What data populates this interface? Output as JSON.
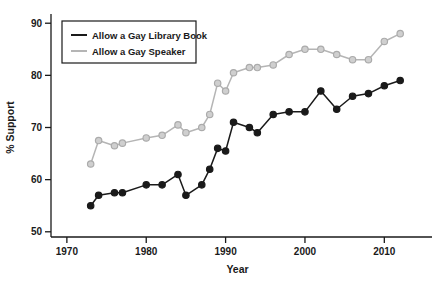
{
  "chart_data": {
    "type": "line",
    "title": "",
    "xlabel": "Year",
    "ylabel": "% Support",
    "xlim": [
      1968,
      2015
    ],
    "ylim": [
      49,
      91
    ],
    "xticks": [
      1970,
      1980,
      1990,
      2000,
      2010
    ],
    "xtick_labels": [
      "1970",
      "1980",
      "1990",
      "2000",
      "2010"
    ],
    "yticks": [
      50,
      60,
      70,
      80,
      90
    ],
    "ytick_labels": [
      "50",
      "60",
      "70",
      "80",
      "90"
    ],
    "grid": false,
    "legend_position": "top-left",
    "series": [
      {
        "name": "Allow a Gay Library Book",
        "color": "#1a1a1a",
        "marker": "filled-circle",
        "x": [
          1973,
          1974,
          1976,
          1977,
          1980,
          1982,
          1984,
          1985,
          1987,
          1988,
          1989,
          1990,
          1991,
          1993,
          1994,
          1996,
          1998,
          2000,
          2002,
          2004,
          2006,
          2008,
          2010,
          2012
        ],
        "values": [
          55.0,
          57.0,
          57.5,
          57.5,
          59.0,
          59.0,
          61.0,
          57.0,
          59.0,
          62.0,
          66.0,
          65.5,
          71.0,
          70.0,
          69.0,
          72.5,
          73.0,
          73.0,
          77.0,
          73.5,
          76.0,
          76.5,
          78.0,
          79.0
        ]
      },
      {
        "name": "Allow a Gay Speaker",
        "color": "#b5b5b5",
        "marker": "filled-circle",
        "x": [
          1973,
          1974,
          1976,
          1977,
          1980,
          1982,
          1984,
          1985,
          1987,
          1988,
          1989,
          1990,
          1991,
          1993,
          1994,
          1996,
          1998,
          2000,
          2002,
          2004,
          2006,
          2008,
          2010,
          2012
        ],
        "values": [
          63.0,
          67.5,
          66.5,
          67.0,
          68.0,
          68.5,
          70.5,
          69.0,
          70.0,
          72.5,
          78.5,
          77.0,
          80.5,
          81.5,
          81.5,
          82.0,
          84.0,
          85.0,
          85.0,
          84.0,
          83.0,
          83.0,
          86.5,
          88.0
        ]
      }
    ]
  },
  "legend": {
    "entries": [
      {
        "label": "Allow a Gay Library Book",
        "color": "#1a1a1a"
      },
      {
        "label": "Allow a Gay Speaker",
        "color": "#b5b5b5"
      }
    ]
  },
  "axes": {
    "x_title": "Year",
    "y_title": "% Support"
  }
}
